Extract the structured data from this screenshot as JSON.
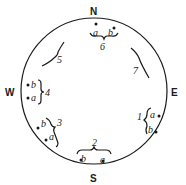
{
  "compass": {
    "north": "N",
    "south": "S",
    "east": "E",
    "west": "W"
  },
  "groups": [
    {
      "id": "1",
      "labels": [
        "a",
        "b"
      ]
    },
    {
      "id": "2",
      "labels": [
        "b",
        "a"
      ]
    },
    {
      "id": "3",
      "labels": [
        "b",
        "a"
      ]
    },
    {
      "id": "4",
      "labels": [
        "b",
        "a"
      ]
    },
    {
      "id": "5",
      "labels": []
    },
    {
      "id": "6",
      "labels": [
        "a",
        "b"
      ]
    },
    {
      "id": "7",
      "labels": []
    }
  ],
  "colors": {
    "ink": "#1a1a1a",
    "background": "#ffffff"
  }
}
